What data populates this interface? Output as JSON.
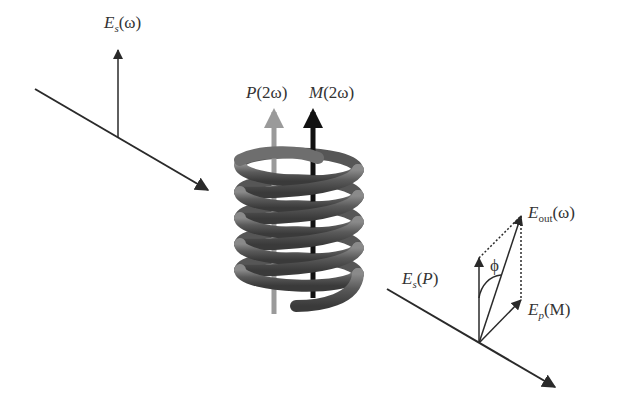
{
  "labels": {
    "es_omega": {
      "main": "E",
      "sub": "s",
      "arg": "(ω)"
    },
    "p_2omega": {
      "main": "P",
      "arg": "(2ω)"
    },
    "m_2omega": {
      "main": "M",
      "arg": "(2ω)"
    },
    "eout_omega": {
      "main": "E",
      "sub": "out",
      "arg": "(ω)"
    },
    "es_p": {
      "main": "E",
      "sub": "s",
      "arg": "(",
      "argvar": "P",
      "argclose": ")"
    },
    "ep_m": {
      "main": "E",
      "sub": "p",
      "arg": "(M)"
    },
    "phi": "ϕ"
  },
  "colors": {
    "ink": "#2a2a2a",
    "p_arrow": "#9a9a9a",
    "m_arrow": "#111111",
    "helix": "#555555",
    "helix_highlight": "#888888"
  }
}
